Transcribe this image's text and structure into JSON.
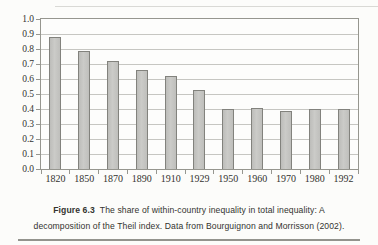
{
  "chart_data": {
    "type": "bar",
    "title": "",
    "xlabel": "",
    "ylabel": "",
    "categories": [
      "1820",
      "1850",
      "1870",
      "1890",
      "1910",
      "1929",
      "1950",
      "1960",
      "1970",
      "1980",
      "1992"
    ],
    "values": [
      0.88,
      0.79,
      0.72,
      0.66,
      0.62,
      0.53,
      0.4,
      0.41,
      0.39,
      0.4,
      0.4
    ],
    "ylim": [
      0.0,
      1.0
    ],
    "ytick_labels": [
      "1.0",
      "0.9",
      "0.8",
      "0.7",
      "0.6",
      "0.5",
      "0.4",
      "0.3",
      "0.2",
      "0.1",
      "0.0"
    ],
    "grid": "horizontal",
    "legend": "none",
    "bar_fill_color": "#c6c6c3",
    "bar_border_color": "#82827d",
    "gridline_color": "#c6c6c2",
    "frame_color": "#96968f"
  },
  "caption": {
    "label": "Figure 6.3",
    "line1": "The share of within-country inequality in total inequality: A",
    "line2": "decomposition of the Theil index. Data from Bourguignon and Morrisson (2002)."
  }
}
